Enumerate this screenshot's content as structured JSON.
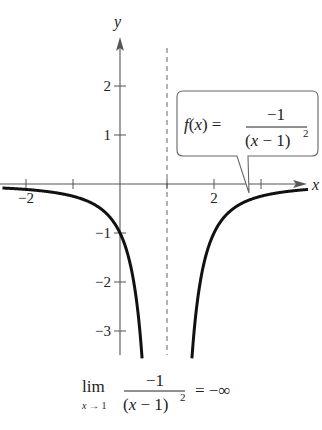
{
  "chart_data": {
    "type": "line",
    "title": "",
    "function_label": "f(x) = -1 / (x - 1)^2",
    "function": {
      "lhs": "f(x) =",
      "numerator": "−1",
      "denominator": "(x − 1)",
      "exponent": "2"
    },
    "xlabel": "x",
    "ylabel": "y",
    "xlim": [
      -2.5,
      4
    ],
    "ylim": [
      -3.5,
      2.6
    ],
    "x_ticks": [
      -2,
      -1,
      0,
      1,
      2,
      3
    ],
    "x_tick_labels": [
      {
        "value": -2,
        "label": "−2"
      },
      {
        "value": 2,
        "label": "2"
      }
    ],
    "y_ticks": [
      2,
      1,
      -1,
      -2,
      -3
    ],
    "y_tick_labels": [
      {
        "value": 2,
        "label": "2"
      },
      {
        "value": 1,
        "label": "1"
      },
      {
        "value": -1,
        "label": "−1"
      },
      {
        "value": -2,
        "label": "−2"
      },
      {
        "value": -3,
        "label": "−3"
      }
    ],
    "asymptote": {
      "type": "vertical",
      "x": 1,
      "style": "dashed"
    },
    "series": [
      {
        "name": "left branch",
        "x": [
          -2.5,
          -2,
          -1.5,
          -1,
          -0.5,
          0,
          0.25,
          0.4,
          0.47
        ],
        "y": [
          -0.08,
          -0.11,
          -0.16,
          -0.25,
          -0.44,
          -1,
          -1.78,
          -2.78,
          -3.56
        ]
      },
      {
        "name": "right branch",
        "x": [
          1.53,
          1.6,
          1.75,
          2,
          2.5,
          3,
          3.5,
          4
        ],
        "y": [
          -3.56,
          -2.78,
          -1.78,
          -1,
          -0.44,
          -0.25,
          -0.16,
          -0.11
        ]
      }
    ],
    "grid": false,
    "legend": "none",
    "annotation": {
      "type": "callout",
      "text": "f(x) = −1/(x − 1)²",
      "points_to_x": 2.75
    },
    "caption": {
      "lim": "lim",
      "sub": "x → 1",
      "numerator": "−1",
      "denominator": "(x − 1)",
      "exponent": "2",
      "result": "= −∞"
    }
  }
}
